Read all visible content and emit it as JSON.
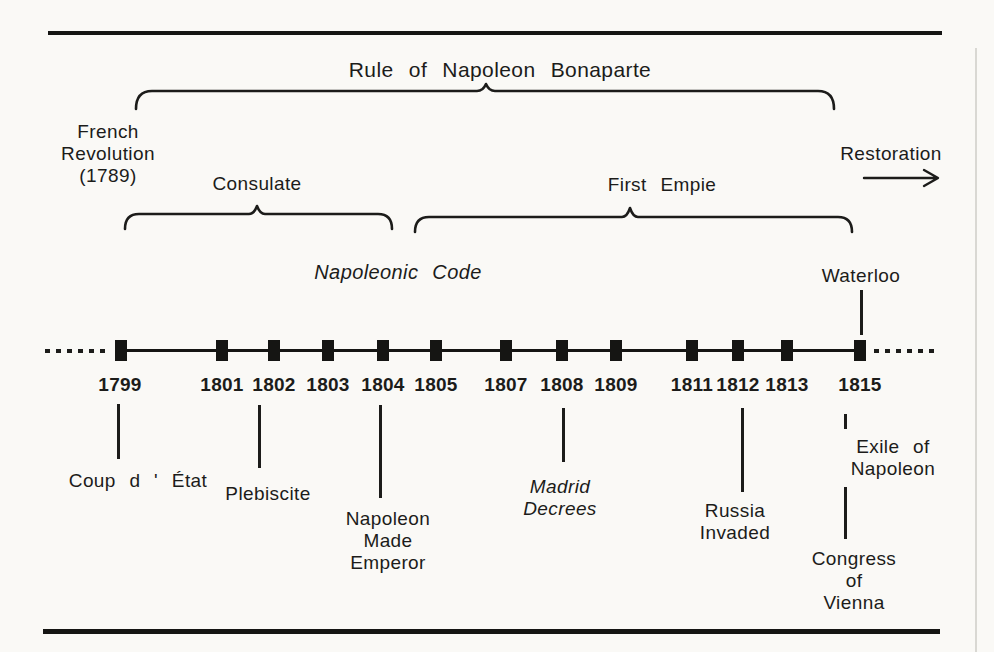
{
  "colors": {
    "ink": "#1c1c1a",
    "paper": "#faf9f6"
  },
  "title": "Rule of Napoleon Bonaparte",
  "periods": {
    "french_revolution": {
      "lines": [
        "French",
        "Revolution",
        "(1789)"
      ]
    },
    "consulate": {
      "label": "Consulate"
    },
    "first_empire": {
      "label": "First Empie"
    },
    "restoration": {
      "label": "Restoration"
    }
  },
  "annotations": {
    "napoleonic_code": "Napoleonic Code",
    "waterloo": "Waterloo"
  },
  "timeline": {
    "years": [
      "1799",
      "1801",
      "1802",
      "1803",
      "1804",
      "1805",
      "1807",
      "1808",
      "1809",
      "1811",
      "1812",
      "1813",
      "1815"
    ]
  },
  "events": {
    "coup": {
      "lines": [
        "Coup d ' État"
      ]
    },
    "plebiscite": {
      "lines": [
        "Plebiscite"
      ]
    },
    "emperor": {
      "lines": [
        "Napoleon",
        "Made",
        "Emperor"
      ]
    },
    "madrid": {
      "lines": [
        "Madrid",
        "Decrees"
      ]
    },
    "russia": {
      "lines": [
        "Russia",
        "Invaded"
      ]
    },
    "exile": {
      "lines": [
        "Exile of",
        "Napoleon"
      ]
    },
    "congress": {
      "lines": [
        "Congress",
        "of",
        "Vienna"
      ]
    }
  }
}
